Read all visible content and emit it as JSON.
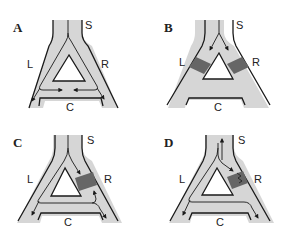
{
  "figure": {
    "colors": {
      "tube_fill": "#d6d6d6",
      "outline": "#1a1a1a",
      "block": "#666666",
      "background": "#ffffff"
    },
    "panels": [
      {
        "id": "A",
        "label": "A",
        "stem": "S",
        "left": "L",
        "right": "R",
        "bottom": "C",
        "blocks": [],
        "description": "Flow from S splits down both L and R limbs; arrows converge in C and exit down each leg"
      },
      {
        "id": "B",
        "label": "B",
        "stem": "S",
        "left": "L",
        "right": "R",
        "bottom": "C",
        "blocks": [
          "left",
          "right"
        ],
        "description": "Both L and R limbs blocked (dark bands); arrows from S stop at blocks"
      },
      {
        "id": "C",
        "label": "C",
        "stem": "S",
        "left": "L",
        "right": "R",
        "bottom": "C",
        "blocks": [
          "right"
        ],
        "description": "R limb blocked; flow travels down L, through C, and retrograde up R to the block"
      },
      {
        "id": "D",
        "label": "D",
        "stem": "S",
        "left": "L",
        "right": "R",
        "bottom": "C",
        "blocks": [
          "right-partial"
        ],
        "description": "R limb partially blocked (zig-zag); retrograde impulse re-enters and returns up S (reentry)"
      }
    ]
  }
}
